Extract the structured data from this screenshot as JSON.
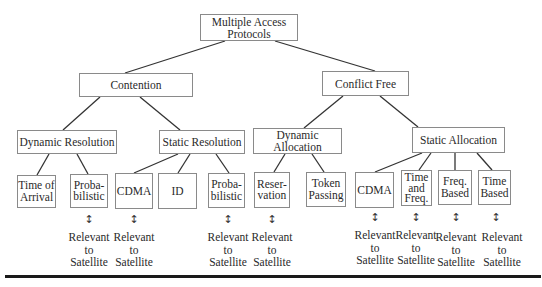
{
  "diagram": {
    "root": {
      "label": "Multiple Access\nProtocols"
    },
    "level1": [
      {
        "id": "contention",
        "label": "Contention"
      },
      {
        "id": "conflict_free",
        "label": "Conflict Free"
      }
    ],
    "level2": [
      {
        "id": "dynamic_resolution",
        "label": "Dynamic Resolution",
        "parent": "contention"
      },
      {
        "id": "static_resolution",
        "label": "Static Resolution",
        "parent": "contention"
      },
      {
        "id": "dynamic_allocation",
        "label": "Dynamic Allocation",
        "parent": "conflict_free"
      },
      {
        "id": "static_allocation",
        "label": "Static Allocation",
        "parent": "conflict_free"
      }
    ],
    "leaves": [
      {
        "id": "time_of_arrival",
        "label": "Time of\nArrival",
        "parent": "dynamic_resolution",
        "relevant": false
      },
      {
        "id": "probabilistic_1",
        "label": "Proba-\nbilistic",
        "parent": "dynamic_resolution",
        "relevant": true
      },
      {
        "id": "cdma_1",
        "label": "CDMA",
        "parent": "static_resolution",
        "relevant": true
      },
      {
        "id": "id",
        "label": "ID",
        "parent": "static_resolution",
        "relevant": false
      },
      {
        "id": "probabilistic_2",
        "label": "Proba-\nbilistic",
        "parent": "static_resolution",
        "relevant": true
      },
      {
        "id": "reservation",
        "label": "Reser-\nvation",
        "parent": "dynamic_allocation",
        "relevant": true
      },
      {
        "id": "token_passing",
        "label": "Token\nPassing",
        "parent": "dynamic_allocation",
        "relevant": false
      },
      {
        "id": "cdma_2",
        "label": "CDMA",
        "parent": "static_allocation",
        "relevant": true
      },
      {
        "id": "time_and_freq",
        "label": "Time\nand\nFreq.",
        "parent": "static_allocation",
        "relevant": true
      },
      {
        "id": "freq_based",
        "label": "Freq.\nBased",
        "parent": "static_allocation",
        "relevant": true
      },
      {
        "id": "time_based",
        "label": "Time\nBased",
        "parent": "static_allocation",
        "relevant": true
      }
    ],
    "relevance_note": "Relevant\nto\nSatellite",
    "arrow_glyph": "↕"
  }
}
